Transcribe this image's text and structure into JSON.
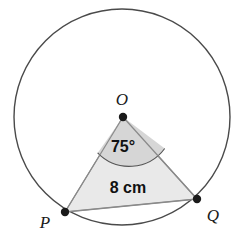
{
  "figure": {
    "background_color": "#ffffff"
  },
  "circle": {
    "name": "circle",
    "center_x": 122,
    "center_y": 117,
    "radius": 108,
    "stroke_color": "#4a4a4a",
    "stroke_width": 1.4,
    "fill": "none"
  },
  "points": {
    "center": {
      "label": "O",
      "x": 123,
      "y": 117,
      "label_x": 122,
      "label_y": 105,
      "dot_radius": 4.2,
      "dot_color": "#1a1a1a"
    },
    "p": {
      "label": "P",
      "x": 65,
      "y": 212,
      "label_x": 45,
      "label_y": 228,
      "dot_radius": 4.2,
      "dot_color": "#1a1a1a"
    },
    "q": {
      "label": "Q",
      "x": 197,
      "y": 199,
      "label_x": 213,
      "label_y": 221,
      "dot_radius": 4.2,
      "dot_color": "#1a1a1a"
    }
  },
  "triangle": {
    "name": "triangle-OPQ",
    "fill_color": "#e9e9e9",
    "stroke_color": "#8a8a8a",
    "stroke_width": 1.2,
    "points": "123,117 65,212 197,199"
  },
  "angle_sector": {
    "label": "75°",
    "value": 75,
    "unit": "degrees",
    "fill_color": "#d6d6d6",
    "stroke_color": "#555555",
    "stroke_width": 1.1,
    "arc_radius": 44,
    "label_x": 123,
    "label_y": 152
  },
  "chord": {
    "label": "8 cm",
    "value": 8,
    "unit": "cm",
    "label_x": 128,
    "label_y": 193,
    "stroke_color": "#8a8a8a"
  },
  "colors": {
    "ink": "#1a1a1a",
    "circle_stroke": "#4a4a4a",
    "triangle_fill": "#e9e9e9",
    "sector_fill": "#d6d6d6"
  }
}
